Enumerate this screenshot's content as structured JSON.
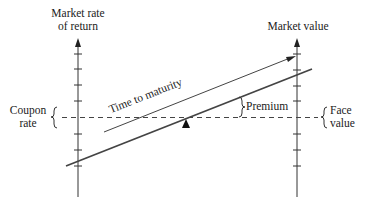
{
  "diagram": {
    "left_axis": {
      "label_line1": "Market rate",
      "label_line2": "of return"
    },
    "right_axis": {
      "label": "Market value"
    },
    "labels": {
      "coupon_line1": "Coupon",
      "coupon_line2": "rate",
      "face_line1": "Face",
      "face_line2": "value",
      "premium": "Premium",
      "time_to_maturity": "Time to maturity"
    },
    "colors": {
      "line": "#333333",
      "background": "#ffffff"
    }
  }
}
